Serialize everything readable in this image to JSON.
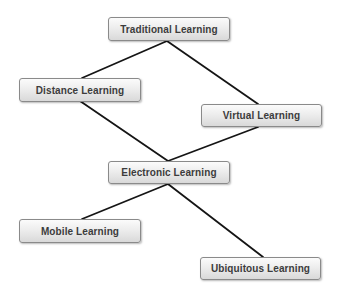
{
  "diagram": {
    "type": "hierarchy",
    "nodes": [
      {
        "id": "traditional",
        "label": "Traditional Learning",
        "x": 108,
        "y": 17,
        "w": 122,
        "h": 24
      },
      {
        "id": "distance",
        "label": "Distance Learning",
        "x": 19,
        "y": 78,
        "w": 122,
        "h": 24
      },
      {
        "id": "virtual",
        "label": "Virtual Learning",
        "x": 201,
        "y": 104,
        "w": 121,
        "h": 23
      },
      {
        "id": "electronic",
        "label": "Electronic Learning",
        "x": 108,
        "y": 161,
        "w": 122,
        "h": 23
      },
      {
        "id": "mobile",
        "label": "Mobile Learning",
        "x": 19,
        "y": 219,
        "w": 122,
        "h": 24
      },
      {
        "id": "ubiquitous",
        "label": "Ubiquitous Learning",
        "x": 200,
        "y": 257,
        "w": 121,
        "h": 23
      }
    ],
    "edges": [
      {
        "from": "traditional",
        "to": "distance",
        "x1": 167,
        "y1": 41,
        "x2": 82,
        "y2": 78
      },
      {
        "from": "traditional",
        "to": "virtual",
        "x1": 167,
        "y1": 41,
        "x2": 258,
        "y2": 104
      },
      {
        "from": "distance",
        "to": "electronic",
        "x1": 80,
        "y1": 101,
        "x2": 168,
        "y2": 161
      },
      {
        "from": "virtual",
        "to": "electronic",
        "x1": 258,
        "y1": 127,
        "x2": 168,
        "y2": 161
      },
      {
        "from": "electronic",
        "to": "mobile",
        "x1": 168,
        "y1": 184,
        "x2": 82,
        "y2": 219
      },
      {
        "from": "electronic",
        "to": "ubiquitous",
        "x1": 168,
        "y1": 184,
        "x2": 263,
        "y2": 257
      }
    ]
  }
}
